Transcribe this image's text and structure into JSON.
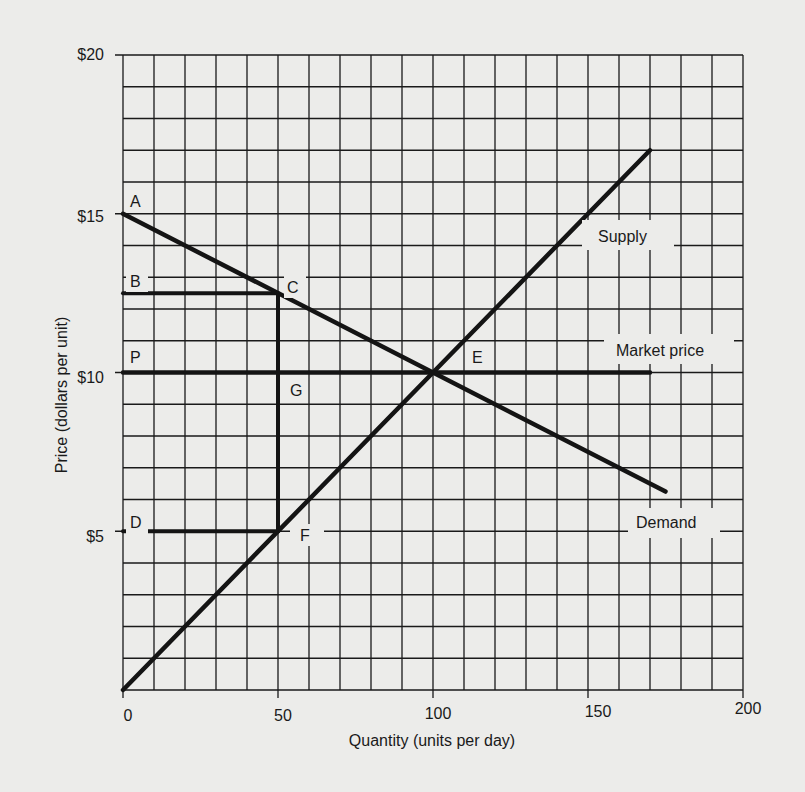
{
  "chart_data": {
    "type": "line",
    "title": "",
    "xlabel": "Quantity (units per day)",
    "ylabel": "Price (dollars per unit)",
    "xlim": [
      0,
      200
    ],
    "ylim": [
      0,
      20
    ],
    "grid": true,
    "grid_step": {
      "x": 10,
      "y": 1
    },
    "x_ticks": [
      0,
      50,
      100,
      150,
      200
    ],
    "x_tick_labels": [
      "0",
      "50",
      "100",
      "150",
      "200"
    ],
    "y_ticks": [
      5,
      10,
      15,
      20
    ],
    "y_tick_labels": [
      "$5",
      "$10",
      "$15",
      "$20"
    ],
    "series": [
      {
        "name": "Demand",
        "points": [
          [
            0,
            15
          ],
          [
            175,
            6.25
          ]
        ]
      },
      {
        "name": "Supply",
        "points": [
          [
            0,
            0
          ],
          [
            170,
            17
          ]
        ]
      },
      {
        "name": "Market price",
        "points": [
          [
            0,
            10
          ],
          [
            170,
            10
          ]
        ]
      }
    ],
    "guides": [
      {
        "name": "B-C",
        "points": [
          [
            0,
            12.5
          ],
          [
            50,
            12.5
          ]
        ]
      },
      {
        "name": "C-F",
        "points": [
          [
            50,
            12.5
          ],
          [
            50,
            5
          ]
        ]
      },
      {
        "name": "D-F",
        "points": [
          [
            0,
            5
          ],
          [
            50,
            5
          ]
        ]
      }
    ],
    "annotations": [
      {
        "text": "A",
        "x": 0,
        "y": 15
      },
      {
        "text": "B",
        "x": 0,
        "y": 12.5
      },
      {
        "text": "C",
        "x": 50,
        "y": 12.5
      },
      {
        "text": "P",
        "x": 0,
        "y": 10
      },
      {
        "text": "G",
        "x": 50,
        "y": 10
      },
      {
        "text": "E",
        "x": 100,
        "y": 10
      },
      {
        "text": "D",
        "x": 0,
        "y": 5
      },
      {
        "text": "F",
        "x": 50,
        "y": 5
      },
      {
        "text": "Supply",
        "x": 150,
        "y": 14
      },
      {
        "text": "Market price",
        "x": 165,
        "y": 11
      },
      {
        "text": "Demand",
        "x": 168,
        "y": 5.5
      }
    ]
  },
  "labels": {
    "xlabel": "Quantity (units per day)",
    "ylabel": "Price (dollars per unit)",
    "x_ticks": [
      "0",
      "50",
      "100",
      "150",
      "200"
    ],
    "y_ticks": [
      "$20",
      "$15",
      "$10",
      "$5"
    ],
    "points": {
      "A": "A",
      "B": "B",
      "C": "C",
      "P": "P",
      "G": "G",
      "E": "E",
      "D": "D",
      "F": "F"
    },
    "supply": "Supply",
    "market_price": "Market price",
    "demand": "Demand"
  }
}
